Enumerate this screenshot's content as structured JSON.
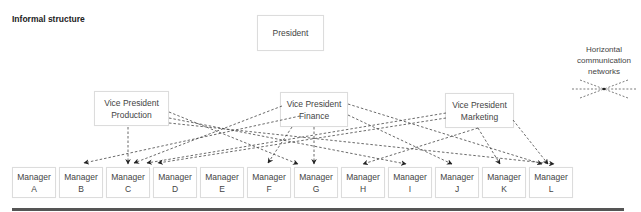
{
  "title": "Informal structure",
  "president": {
    "label": "President"
  },
  "vice_presidents": [
    {
      "line1": "Vice President",
      "line2": "Production"
    },
    {
      "line1": "Vice President",
      "line2": "Finance"
    },
    {
      "line1": "Vice President",
      "line2": "Marketing"
    }
  ],
  "managers": [
    {
      "line1": "Manager",
      "line2": "A"
    },
    {
      "line1": "Manager",
      "line2": "B"
    },
    {
      "line1": "Manager",
      "line2": "C"
    },
    {
      "line1": "Manager",
      "line2": "D"
    },
    {
      "line1": "Manager",
      "line2": "E"
    },
    {
      "line1": "Manager",
      "line2": "F"
    },
    {
      "line1": "Manager",
      "line2": "G"
    },
    {
      "line1": "Manager",
      "line2": "H"
    },
    {
      "line1": "Manager",
      "line2": "I"
    },
    {
      "line1": "Manager",
      "line2": "J"
    },
    {
      "line1": "Manager",
      "line2": "K"
    },
    {
      "line1": "Manager",
      "line2": "L"
    }
  ],
  "legend": {
    "line1": "Horizontal",
    "line2": "communication",
    "line3": "networks",
    "icon": "crossed-dashed-arrows-icon"
  },
  "connections": [
    {
      "from": "Vice President Production",
      "to": "Manager B"
    },
    {
      "from": "Vice President Production",
      "to": "Manager C"
    },
    {
      "from": "Vice President Production",
      "to": "Manager G"
    },
    {
      "from": "Vice President Production",
      "to": "Manager I"
    },
    {
      "from": "Vice President Production",
      "to": "Manager L"
    },
    {
      "from": "Vice President Finance",
      "to": "Manager C"
    },
    {
      "from": "Vice President Finance",
      "to": "Manager F"
    },
    {
      "from": "Vice President Finance",
      "to": "Manager G"
    },
    {
      "from": "Vice President Finance",
      "to": "Manager J"
    },
    {
      "from": "Vice President Finance",
      "to": "Manager L"
    },
    {
      "from": "Vice President Marketing",
      "to": "Manager C"
    },
    {
      "from": "Vice President Marketing",
      "to": "Manager D"
    },
    {
      "from": "Vice President Marketing",
      "to": "Manager H"
    },
    {
      "from": "Vice President Marketing",
      "to": "Manager K"
    },
    {
      "from": "Vice President Marketing",
      "to": "Manager L"
    }
  ],
  "colors": {
    "line": "#444444",
    "box_border": "#dcdcdc",
    "rule": "#555555"
  }
}
